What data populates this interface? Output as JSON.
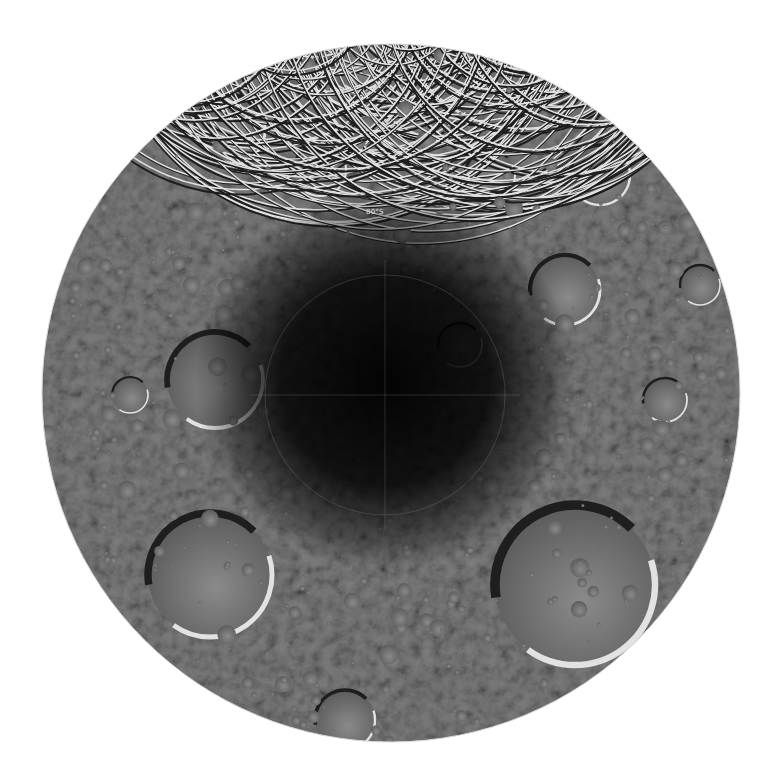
{
  "image": {
    "subject": "Lunar south pole mosaic (polar projection)",
    "background_color": "#ffffff",
    "disc": {
      "cx": 391,
      "cy": 393,
      "r": 349,
      "base_color": "#7a7a7a"
    },
    "pole": {
      "cx": 385,
      "cy": 395
    },
    "graticule": {
      "latitude_label": "80°S",
      "label_position": {
        "x": 366,
        "y": 208
      },
      "latitude_circle_radius": 120
    },
    "colors": {
      "regolith_light": "#a8a8a8",
      "regolith_mid": "#7a7a7a",
      "regolith_dark": "#4a4a4a",
      "shadow": "#050505",
      "rim_highlight": "#e6e6e6"
    },
    "large_craters": [
      {
        "name": "crater-lower-left",
        "cx": 210,
        "cy": 575,
        "r": 62
      },
      {
        "name": "crater-lower-right",
        "cx": 575,
        "cy": 585,
        "r": 80
      },
      {
        "name": "crater-left",
        "cx": 215,
        "cy": 380,
        "r": 48
      },
      {
        "name": "crater-right",
        "cx": 665,
        "cy": 400,
        "r": 22
      },
      {
        "name": "crater-upper-left",
        "cx": 230,
        "cy": 130,
        "r": 35
      },
      {
        "name": "crater-upper-right",
        "cx": 600,
        "cy": 175,
        "r": 30
      },
      {
        "name": "crater-top",
        "cx": 360,
        "cy": 62,
        "r": 28
      },
      {
        "name": "crater-near-pole-right",
        "cx": 460,
        "cy": 345,
        "r": 22
      },
      {
        "name": "crater-right-mid",
        "cx": 565,
        "cy": 290,
        "r": 35
      },
      {
        "name": "crater-upper-mid",
        "cx": 320,
        "cy": 170,
        "r": 26
      },
      {
        "name": "crater-upper-center",
        "cx": 490,
        "cy": 175,
        "r": 25
      },
      {
        "name": "crater-far-right",
        "cx": 700,
        "cy": 285,
        "r": 20
      },
      {
        "name": "crater-left-mid",
        "cx": 130,
        "cy": 395,
        "r": 18
      },
      {
        "name": "crater-bottom",
        "cx": 345,
        "cy": 720,
        "r": 30
      }
    ]
  }
}
